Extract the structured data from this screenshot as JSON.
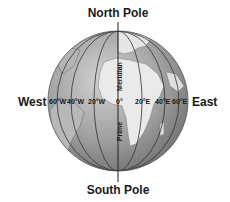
{
  "diagram": {
    "labels": {
      "north_pole": "North Pole",
      "south_pole": "South Pole",
      "west": "West",
      "east": "East",
      "meridian_upper": "Meridian",
      "meridian_lower": "Prime"
    },
    "longitudes_west": [
      "60°W",
      "40°W",
      "20°W"
    ],
    "longitudes_zero": "0°",
    "longitudes_east": [
      "20°E",
      "40°E",
      "60°E"
    ],
    "colors": {
      "ocean": "#9a9a9a",
      "land": "#e8e8e8",
      "lines": "#333333",
      "text": "#1a1a1a"
    }
  }
}
